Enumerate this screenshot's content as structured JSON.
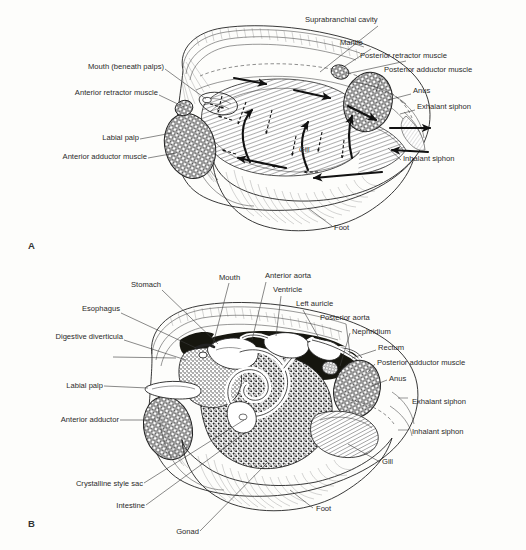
{
  "figure": {
    "background_color": "#fdfdfb",
    "ink_color": "#1a1a1a"
  },
  "panels": [
    {
      "id": "A",
      "letter": "A",
      "caption": "Water-current pathways through the mantle cavity",
      "labels": [
        {
          "key": "suprabranchial_cavity",
          "text": "Suprabranchial cavity",
          "side": "right",
          "x": 305,
          "y": 22
        },
        {
          "key": "mantle",
          "text": "Mantle",
          "side": "right",
          "x": 340,
          "y": 45
        },
        {
          "key": "posterior_retractor_muscle",
          "text": "Posterior retractor muscle",
          "side": "right",
          "x": 360,
          "y": 58
        },
        {
          "key": "posterior_adductor_muscle",
          "text": "Posterior adductor muscle",
          "side": "right",
          "x": 384,
          "y": 72
        },
        {
          "key": "anus",
          "text": "Anus",
          "side": "right",
          "x": 413,
          "y": 93
        },
        {
          "key": "exhalant_siphon",
          "text": "Exhalant siphon",
          "side": "right",
          "x": 417,
          "y": 109
        },
        {
          "key": "inhalant_siphon",
          "text": "Inhalant siphon",
          "side": "right",
          "x": 403,
          "y": 161
        },
        {
          "key": "mouth_beneath_palps",
          "text": "Mouth (beneath palps)",
          "side": "left",
          "x": 50,
          "y": 66
        },
        {
          "key": "anterior_retractor_muscle",
          "text": "Anterior retractor muscle",
          "side": "left",
          "x": 32,
          "y": 92
        },
        {
          "key": "labial_palp",
          "text": "Labial palp",
          "side": "left",
          "x": 85,
          "y": 137
        },
        {
          "key": "anterior_adductor_muscle",
          "text": "Anterior adductor muscle",
          "side": "left",
          "x": 16,
          "y": 156
        },
        {
          "key": "gill",
          "text": "Gill",
          "side": "inner",
          "x": 299,
          "y": 150
        },
        {
          "key": "foot",
          "text": "Foot",
          "side": "bottom",
          "x": 333,
          "y": 228
        }
      ]
    },
    {
      "id": "B",
      "letter": "B",
      "caption": "Organ systems: digestive, circulatory, excretory and reproductive",
      "labels": [
        {
          "key": "stomach",
          "text": "Stomach",
          "side": "left",
          "x": 118,
          "y": 287
        },
        {
          "key": "esophagus",
          "text": "Esophagus",
          "side": "left",
          "x": 69,
          "y": 311
        },
        {
          "key": "digestive_diverticula",
          "text": "Digestive diverticula",
          "side": "left",
          "x": 18,
          "y": 338
        },
        {
          "key": "labial_palp",
          "text": "Labial palp",
          "side": "left",
          "x": 52,
          "y": 388
        },
        {
          "key": "anterior_adductor",
          "text": "Anterior adductor",
          "side": "left",
          "x": 29,
          "y": 422
        },
        {
          "key": "crystalline_style_sac",
          "text": "Crystalline style sac",
          "side": "left",
          "x": 29,
          "y": 485
        },
        {
          "key": "intestine",
          "text": "Intestine",
          "side": "left",
          "x": 100,
          "y": 507
        },
        {
          "key": "gonad",
          "text": "Gonad",
          "side": "bottom",
          "x": 177,
          "y": 534
        },
        {
          "key": "mouth",
          "text": "Mouth",
          "side": "top",
          "x": 219,
          "y": 280
        },
        {
          "key": "anterior_aorta",
          "text": "Anterior aorta",
          "side": "top",
          "x": 265,
          "y": 278
        },
        {
          "key": "ventricle",
          "text": "Ventricle",
          "side": "top",
          "x": 273,
          "y": 292
        },
        {
          "key": "left_auricle",
          "text": "Left auricle",
          "side": "top",
          "x": 296,
          "y": 306
        },
        {
          "key": "posterior_aorta",
          "text": "Posterior aorta",
          "side": "right",
          "x": 320,
          "y": 320
        },
        {
          "key": "nephridium",
          "text": "Nephridium",
          "side": "right",
          "x": 352,
          "y": 334
        },
        {
          "key": "rectum",
          "text": "Rectum",
          "side": "right",
          "x": 378,
          "y": 350
        },
        {
          "key": "posterior_adductor_muscle",
          "text": "Posterior adductor muscle",
          "side": "right",
          "x": 377,
          "y": 365
        },
        {
          "key": "anus",
          "text": "Anus",
          "side": "right",
          "x": 389,
          "y": 381
        },
        {
          "key": "exhalant_siphon",
          "text": "Exhalant siphon",
          "side": "right",
          "x": 392,
          "y": 404
        },
        {
          "key": "inhalant_siphon",
          "text": "Inhalant siphon",
          "side": "right",
          "x": 392,
          "y": 434
        },
        {
          "key": "gill",
          "text": "Gill",
          "side": "right",
          "x": 382,
          "y": 462
        },
        {
          "key": "foot",
          "text": "Foot",
          "side": "bottom",
          "x": 315,
          "y": 509
        }
      ]
    }
  ]
}
